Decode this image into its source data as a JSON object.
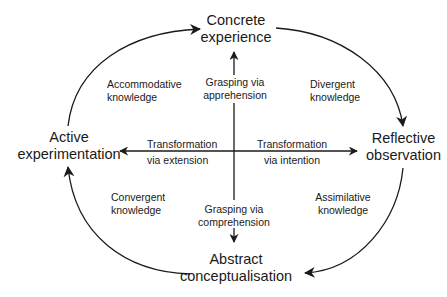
{
  "nodes": {
    "top": {
      "line1": "Concrete",
      "line2": "experience"
    },
    "right": {
      "line1": "Reflective",
      "line2": "observation"
    },
    "bottom": {
      "line1": "Abstract",
      "line2": "conceptualisation"
    },
    "left": {
      "line1": "Active",
      "line2": "experimentation"
    }
  },
  "quadrants": {
    "top_left": {
      "line1": "Accommodative",
      "line2": "knowledge"
    },
    "top_right": {
      "line1": "Divergent",
      "line2": "knowledge"
    },
    "bottom_left": {
      "line1": "Convergent",
      "line2": "knowledge"
    },
    "bottom_right": {
      "line1": "Assimilative",
      "line2": "knowledge"
    }
  },
  "axes": {
    "up": {
      "line1": "Grasping via",
      "line2": "apprehension"
    },
    "down": {
      "line1": "Grasping via",
      "line2": "comprehension"
    },
    "left": {
      "line1": "Transformation",
      "line2": "via extension"
    },
    "right": {
      "line1": "Transformation",
      "line2": "via intention"
    }
  }
}
